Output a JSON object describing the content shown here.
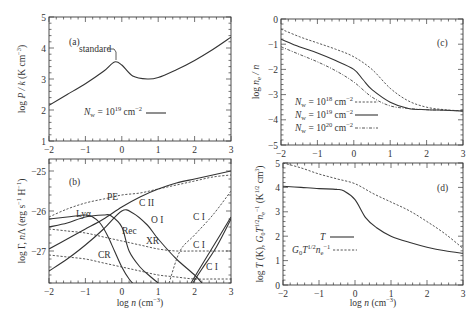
{
  "chart_data": [
    {
      "panel": "a",
      "type": "line",
      "xlabel": "",
      "ylabel": "log P / k (K cm^-3)",
      "xlim": [
        -2,
        3
      ],
      "ylim": [
        1,
        5
      ],
      "xticks": [
        "-2",
        "-1",
        "0",
        "1",
        "2",
        "3"
      ],
      "yticks": [
        "1",
        "2",
        "3",
        "4",
        "5"
      ],
      "panel_label": "(a)",
      "annotations": [
        "standard"
      ],
      "legend": [
        {
          "label": "N_w = 10^19 cm^-2",
          "style": "solid"
        }
      ],
      "series": [
        {
          "name": "N_w = 10^19 cm^-2",
          "style": "solid",
          "x": [
            -2,
            -1.5,
            -1,
            -0.5,
            -0.2,
            0,
            0.3,
            0.7,
            1,
            1.5,
            2,
            2.5,
            3
          ],
          "y": [
            2.15,
            2.5,
            2.85,
            3.25,
            3.55,
            3.45,
            3.1,
            3.0,
            3.05,
            3.3,
            3.6,
            3.95,
            4.35
          ]
        }
      ]
    },
    {
      "panel": "b",
      "type": "line",
      "xlabel": "log n (cm^-3)",
      "ylabel": "log Γ, nΛ (erg s^-1 H^-1)",
      "xlim": [
        -2,
        3
      ],
      "ylim": [
        -27.8,
        -24.7
      ],
      "xticks": [
        "-2",
        "-1",
        "0",
        "1",
        "2",
        "3"
      ],
      "yticks": [
        "-25",
        "-26",
        "-27"
      ],
      "panel_label": "(b)",
      "series": [
        {
          "name": "PE",
          "style": "dashed",
          "x": [
            -2,
            -1.5,
            -1,
            -0.5,
            0,
            0.5,
            1,
            1.5,
            2,
            2.5,
            3
          ],
          "y": [
            -26.15,
            -25.95,
            -25.8,
            -25.7,
            -25.6,
            -25.55,
            -25.45,
            -25.35,
            -25.25,
            -25.15,
            -25.1
          ]
        },
        {
          "name": "C II",
          "style": "solid",
          "x": [
            -2,
            -1.5,
            -1,
            -0.5,
            0,
            0.5,
            1,
            1.5,
            2,
            2.5,
            3
          ],
          "y": [
            -26.95,
            -26.7,
            -26.45,
            -26.2,
            -25.9,
            -25.65,
            -25.45,
            -25.3,
            -25.2,
            -25.1,
            -25.0
          ]
        },
        {
          "name": "Lyα",
          "style": "solid",
          "x": [
            -2,
            -1.5,
            -1,
            -0.8,
            -0.6,
            -0.4,
            -0.2,
            0,
            0.2,
            0.4
          ],
          "y": [
            -26.2,
            -26.15,
            -26.1,
            -26.15,
            -26.3,
            -26.6,
            -27.0,
            -27.4,
            -27.7,
            -27.9
          ]
        },
        {
          "name": "O I",
          "style": "solid",
          "x": [
            -2,
            -1.5,
            -1,
            -0.5,
            0,
            0.3,
            0.7,
            1,
            1.5,
            2,
            2.2
          ],
          "y": [
            -27.5,
            -27.2,
            -26.85,
            -26.45,
            -26.0,
            -26.05,
            -26.35,
            -26.7,
            -27.2,
            -27.6,
            -27.8
          ]
        },
        {
          "name": "Rec",
          "style": "solid",
          "x": [
            -2,
            -1.5,
            -1,
            -0.5,
            -0.3,
            0,
            0.2,
            0.5,
            0.8,
            1.0
          ],
          "y": [
            -26.4,
            -26.3,
            -26.15,
            -26.1,
            -26.12,
            -26.4,
            -27.0,
            -27.4,
            -27.65,
            -27.8
          ]
        },
        {
          "name": "XR",
          "style": "dashed",
          "x": [
            -2,
            -1.5,
            -1,
            -0.5,
            0,
            0.5,
            1,
            1.5,
            2,
            2.5,
            3
          ],
          "y": [
            -26.45,
            -26.5,
            -26.55,
            -26.65,
            -26.75,
            -26.85,
            -26.95,
            -27.0,
            -27.0,
            -27.0,
            -27.0
          ]
        },
        {
          "name": "CR",
          "style": "dashed",
          "x": [
            -2,
            -1.5,
            -1,
            -0.5,
            0,
            0.5,
            1,
            1.5,
            2,
            2.5,
            3
          ],
          "y": [
            -27.1,
            -27.15,
            -27.2,
            -27.3,
            -27.4,
            -27.5,
            -27.6,
            -27.65,
            -27.7,
            -27.7,
            -27.7
          ]
        },
        {
          "name": "C I (a)",
          "style": "dashed",
          "x": [
            1.3,
            1.6,
            2,
            2.5,
            3
          ],
          "y": [
            -27.8,
            -27.0,
            -26.6,
            -26.1,
            -25.5
          ]
        },
        {
          "name": "C I (b)",
          "style": "solid",
          "x": [
            1.9,
            2.1,
            2.5,
            3
          ],
          "y": [
            -27.8,
            -27.5,
            -26.9,
            -26.15
          ]
        },
        {
          "name": "C I (c)",
          "style": "solid",
          "x": [
            1.95,
            2.2,
            2.6,
            3
          ],
          "y": [
            -27.8,
            -27.45,
            -26.9,
            -26.2
          ]
        }
      ],
      "annotations": [
        "PE",
        "Lyα",
        "C II",
        "O I",
        "Rec",
        "XR",
        "CR",
        "C I",
        "C I",
        "C I"
      ]
    },
    {
      "panel": "c",
      "type": "line",
      "xlabel": "",
      "ylabel": "log n_e / n",
      "xlim": [
        -2,
        3
      ],
      "ylim": [
        -5,
        0
      ],
      "xticks": [
        "-2",
        "-1",
        "0",
        "1",
        "2",
        "3"
      ],
      "yticks": [
        "0",
        "-1",
        "-2",
        "-3",
        "-4",
        "-5"
      ],
      "panel_label": "(c)",
      "legend": [
        {
          "label": "N_w = 10^18 cm^-2",
          "style": "dotted"
        },
        {
          "label": "N_w = 10^19 cm^-2",
          "style": "solid"
        },
        {
          "label": "N_w = 10^20 cm^-2",
          "style": "dashdot"
        }
      ],
      "series": [
        {
          "name": "N_w = 10^18 cm^-2",
          "style": "dotted",
          "x": [
            -2,
            -1.5,
            -1,
            -0.5,
            0,
            0.5,
            1,
            1.5,
            2,
            2.5,
            3
          ],
          "y": [
            -0.4,
            -0.7,
            -0.95,
            -1.2,
            -1.5,
            -2.0,
            -2.75,
            -3.25,
            -3.5,
            -3.6,
            -3.65
          ]
        },
        {
          "name": "N_w = 10^19 cm^-2",
          "style": "solid",
          "x": [
            -2,
            -1.5,
            -1,
            -0.5,
            0,
            0.25,
            0.5,
            1,
            1.5,
            2,
            2.5,
            3
          ],
          "y": [
            -0.8,
            -1.1,
            -1.35,
            -1.65,
            -2.0,
            -2.4,
            -2.8,
            -3.3,
            -3.55,
            -3.6,
            -3.62,
            -3.65
          ]
        },
        {
          "name": "N_w = 10^20 cm^-2",
          "style": "dashdot",
          "x": [
            -2,
            -1.5,
            -1,
            -0.5,
            0,
            0.5,
            1,
            1.5,
            2,
            2.5,
            3
          ],
          "y": [
            -1.1,
            -1.4,
            -1.7,
            -2.05,
            -2.5,
            -3.1,
            -3.45,
            -3.55,
            -3.6,
            -3.62,
            -3.65
          ]
        }
      ]
    },
    {
      "panel": "d",
      "type": "line",
      "xlabel": "log n (cm^-3)",
      "ylabel": "log T (K), G_0 T^{1/2} n_e^-1 (K^{1/2} cm^3)",
      "xlim": [
        -2,
        3
      ],
      "ylim": [
        0,
        5
      ],
      "xticks": [
        "-2",
        "-1",
        "0",
        "1",
        "2",
        "3"
      ],
      "yticks": [
        "0",
        "1",
        "2",
        "3",
        "4",
        "5"
      ],
      "panel_label": "(d)",
      "legend": [
        {
          "label": "T",
          "style": "solid"
        },
        {
          "label": "G_0 T^{1/2} n_e^-1",
          "style": "dotted"
        }
      ],
      "series": [
        {
          "name": "T",
          "style": "solid",
          "x": [
            -2,
            -1.5,
            -1,
            -0.5,
            -0.3,
            0,
            0.3,
            0.6,
            1,
            1.5,
            2,
            2.5,
            3
          ],
          "y": [
            4.05,
            4.0,
            3.95,
            3.92,
            3.85,
            3.5,
            2.75,
            2.35,
            2.0,
            1.75,
            1.55,
            1.4,
            1.3
          ]
        },
        {
          "name": "G_0 T^{1/2} n_e^-1",
          "style": "dotted",
          "x": [
            -2,
            -1.5,
            -1,
            -0.5,
            0,
            0.5,
            1,
            1.5,
            2,
            2.5,
            3
          ],
          "y": [
            5.0,
            4.8,
            4.55,
            4.35,
            4.15,
            3.75,
            3.4,
            3.05,
            2.6,
            2.1,
            1.5
          ]
        }
      ]
    }
  ],
  "labels": {
    "a_panel": "(a)",
    "a_standard": "standard",
    "a_legend": "N",
    "a_legend_sub": "w",
    "a_legend_eq": " = 10",
    "a_legend_exp": "19",
    "a_legend_unit": " cm",
    "a_legend_unit_exp": "−2",
    "a_ylabel": "log P / k (K cm",
    "b_panel": "(b)",
    "b_ylabel": "log Γ, nΛ (erg s",
    "b_xlabel": "log n (cm",
    "c_panel": "(c)",
    "c_ylabel": "log n",
    "d_panel": "(d)",
    "d_xlabel": "log n (cm",
    "d_ylabel": "log T (K), G",
    "ann_pe": "PE",
    "ann_lya": "Lyα",
    "ann_cii": "C II",
    "ann_oi": "O I",
    "ann_rec": "Rec",
    "ann_xr": "XR",
    "ann_cr": "CR",
    "ann_ci": "C I",
    "c_leg18": "10",
    "c_leg18e": "18",
    "c_leg19e": "19",
    "c_leg20e": "20",
    "d_leg_t": "T",
    "d_leg_g": "G",
    "d_leg_g0": "0",
    "d_leg_t2": "T",
    "d_leg_half": "1/2",
    "d_leg_n": "n",
    "d_leg_e": "e",
    "d_leg_m1": "−1"
  }
}
